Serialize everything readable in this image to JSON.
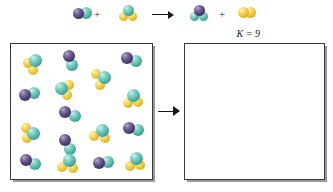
{
  "figure": {
    "type": "chemical-equilibrium-diagram",
    "equilibrium_constant_label": "K = 9"
  },
  "legend": {
    "atom_colors": {
      "purple": "#4a3a6b",
      "teal": "#4fb5a8",
      "yellow": "#e9c63c"
    }
  },
  "equation": {
    "plus_1": "+",
    "plus_2": "+",
    "arrow": "reaction-arrow",
    "reactants": [
      {
        "name": "diatomic-purple-teal",
        "atoms": [
          {
            "color": "purple",
            "x": 0,
            "y": 2,
            "d": 11,
            "z": 2
          },
          {
            "color": "teal",
            "x": 7,
            "y": 1,
            "d": 12,
            "z": 1
          }
        ]
      },
      {
        "name": "triatomic-teal-yellow",
        "atoms": [
          {
            "color": "teal",
            "x": 4,
            "y": 0,
            "d": 11,
            "z": 3
          },
          {
            "color": "yellow",
            "x": 0,
            "y": 7,
            "d": 9,
            "z": 2
          },
          {
            "color": "yellow",
            "x": 9,
            "y": 7,
            "d": 9,
            "z": 1
          }
        ]
      }
    ],
    "products": [
      {
        "name": "triatomic-purple-teal",
        "atoms": [
          {
            "color": "purple",
            "x": 4,
            "y": 0,
            "d": 11,
            "z": 3
          },
          {
            "color": "teal",
            "x": 0,
            "y": 7,
            "d": 9,
            "z": 2
          },
          {
            "color": "teal",
            "x": 9,
            "y": 7,
            "d": 9,
            "z": 1
          }
        ]
      },
      {
        "name": "diatomic-yellow-yellow",
        "atoms": [
          {
            "color": "yellow",
            "x": 0,
            "y": 1,
            "d": 11,
            "z": 2
          },
          {
            "color": "yellow",
            "x": 7,
            "y": 1,
            "d": 11,
            "z": 1
          }
        ]
      }
    ],
    "layout": {
      "reactant_1_x": 73,
      "reactant_1_y": 6,
      "plus_1_x": 94,
      "plus_1_y": 9,
      "reactant_2_x": 119,
      "reactant_2_y": 5,
      "arrow_x": 152,
      "arrow_y": 10,
      "arrow_width": 22,
      "product_1_x": 190,
      "product_1_y": 5,
      "plus_2_x": 219,
      "plus_2_y": 9,
      "product_2_x": 238,
      "product_2_y": 6
    }
  },
  "left_vessel": {
    "name": "initial-mixture-box",
    "x": 10,
    "y": 43,
    "width": 143,
    "height": 137,
    "molecules": [
      {
        "name": "triatomic-teal-yellow",
        "x": 12,
        "y": 10,
        "atoms": [
          {
            "color": "teal",
            "x": 6,
            "y": 0,
            "d": 13,
            "z": 3
          },
          {
            "color": "yellow",
            "x": 0,
            "y": 4,
            "d": 10,
            "z": 2
          },
          {
            "color": "yellow",
            "x": 5,
            "y": 11,
            "d": 10,
            "z": 1
          }
        ]
      },
      {
        "name": "diatomic-purple-teal",
        "x": 52,
        "y": 6,
        "atoms": [
          {
            "color": "purple",
            "x": 0,
            "y": 0,
            "d": 12,
            "z": 2
          },
          {
            "color": "teal",
            "x": 3,
            "y": 9,
            "d": 12,
            "z": 1
          }
        ]
      },
      {
        "name": "diatomic-purple-teal",
        "x": 110,
        "y": 8,
        "atoms": [
          {
            "color": "purple",
            "x": 0,
            "y": 0,
            "d": 12,
            "z": 2
          },
          {
            "color": "teal",
            "x": 9,
            "y": 3,
            "d": 12,
            "z": 1
          }
        ]
      },
      {
        "name": "triatomic-teal-yellow",
        "x": 44,
        "y": 36,
        "atoms": [
          {
            "color": "teal",
            "x": 0,
            "y": 2,
            "d": 13,
            "z": 3
          },
          {
            "color": "yellow",
            "x": 9,
            "y": 0,
            "d": 10,
            "z": 2
          },
          {
            "color": "yellow",
            "x": 7,
            "y": 10,
            "d": 10,
            "z": 1
          }
        ]
      },
      {
        "name": "triatomic-teal-yellow",
        "x": 80,
        "y": 25,
        "atoms": [
          {
            "color": "teal",
            "x": 7,
            "y": 2,
            "d": 13,
            "z": 3
          },
          {
            "color": "yellow",
            "x": 0,
            "y": 0,
            "d": 10,
            "z": 2
          },
          {
            "color": "yellow",
            "x": 4,
            "y": 11,
            "d": 10,
            "z": 1
          }
        ]
      },
      {
        "name": "diatomic-purple-teal",
        "x": 8,
        "y": 43,
        "atoms": [
          {
            "color": "purple",
            "x": 0,
            "y": 2,
            "d": 12,
            "z": 2
          },
          {
            "color": "teal",
            "x": 9,
            "y": 0,
            "d": 12,
            "z": 1
          }
        ]
      },
      {
        "name": "triatomic-teal-yellow",
        "x": 112,
        "y": 45,
        "atoms": [
          {
            "color": "teal",
            "x": 4,
            "y": 0,
            "d": 13,
            "z": 3
          },
          {
            "color": "yellow",
            "x": 0,
            "y": 9,
            "d": 10,
            "z": 2
          },
          {
            "color": "yellow",
            "x": 10,
            "y": 8,
            "d": 10,
            "z": 1
          }
        ]
      },
      {
        "name": "diatomic-purple-teal",
        "x": 48,
        "y": 62,
        "atoms": [
          {
            "color": "purple",
            "x": 0,
            "y": 0,
            "d": 12,
            "z": 2
          },
          {
            "color": "teal",
            "x": 10,
            "y": 4,
            "d": 12,
            "z": 1
          }
        ]
      },
      {
        "name": "triatomic-teal-yellow",
        "x": 10,
        "y": 79,
        "atoms": [
          {
            "color": "teal",
            "x": 6,
            "y": 4,
            "d": 13,
            "z": 3
          },
          {
            "color": "yellow",
            "x": 0,
            "y": 0,
            "d": 10,
            "z": 2
          },
          {
            "color": "yellow",
            "x": 1,
            "y": 10,
            "d": 10,
            "z": 1
          }
        ]
      },
      {
        "name": "triatomic-teal-yellow",
        "x": 78,
        "y": 80,
        "atoms": [
          {
            "color": "teal",
            "x": 7,
            "y": 0,
            "d": 13,
            "z": 3
          },
          {
            "color": "yellow",
            "x": 0,
            "y": 7,
            "d": 10,
            "z": 2
          },
          {
            "color": "yellow",
            "x": 11,
            "y": 9,
            "d": 10,
            "z": 1
          }
        ]
      },
      {
        "name": "diatomic-purple-teal",
        "x": 112,
        "y": 78,
        "atoms": [
          {
            "color": "purple",
            "x": 0,
            "y": 0,
            "d": 12,
            "z": 2
          },
          {
            "color": "teal",
            "x": 9,
            "y": 2,
            "d": 12,
            "z": 1
          }
        ]
      },
      {
        "name": "diatomic-purple-teal",
        "x": 48,
        "y": 90,
        "atoms": [
          {
            "color": "purple",
            "x": 0,
            "y": 0,
            "d": 12,
            "z": 2
          },
          {
            "color": "teal",
            "x": 5,
            "y": 9,
            "d": 12,
            "z": 1
          }
        ]
      },
      {
        "name": "diatomic-purple-teal",
        "x": 9,
        "y": 110,
        "atoms": [
          {
            "color": "purple",
            "x": 0,
            "y": 0,
            "d": 12,
            "z": 2
          },
          {
            "color": "teal",
            "x": 9,
            "y": 4,
            "d": 12,
            "z": 1
          }
        ]
      },
      {
        "name": "triatomic-teal-yellow",
        "x": 46,
        "y": 110,
        "atoms": [
          {
            "color": "teal",
            "x": 6,
            "y": 0,
            "d": 13,
            "z": 3
          },
          {
            "color": "yellow",
            "x": 0,
            "y": 8,
            "d": 10,
            "z": 2
          },
          {
            "color": "yellow",
            "x": 11,
            "y": 9,
            "d": 10,
            "z": 1
          }
        ]
      },
      {
        "name": "diatomic-purple-teal",
        "x": 82,
        "y": 112,
        "atoms": [
          {
            "color": "purple",
            "x": 0,
            "y": 1,
            "d": 12,
            "z": 2
          },
          {
            "color": "teal",
            "x": 9,
            "y": 0,
            "d": 12,
            "z": 1
          }
        ]
      },
      {
        "name": "triatomic-teal-yellow",
        "x": 114,
        "y": 108,
        "atoms": [
          {
            "color": "teal",
            "x": 5,
            "y": 0,
            "d": 13,
            "z": 3
          },
          {
            "color": "yellow",
            "x": 0,
            "y": 9,
            "d": 10,
            "z": 2
          },
          {
            "color": "yellow",
            "x": 10,
            "y": 8,
            "d": 10,
            "z": 1
          }
        ]
      },
      {
        "name": "triatomic-teal-yellow",
        "x": 14,
        "y": 2,
        "atoms": [
          {
            "color": "teal",
            "x": 0,
            "y": 0,
            "d": 0,
            "z": 0
          }
        ]
      },
      {
        "name": "diatomic-purple-teal",
        "x": 78,
        "y": 52,
        "atoms": [
          {
            "color": "purple",
            "x": 0,
            "y": 0,
            "d": 0,
            "z": 0
          }
        ]
      }
    ]
  },
  "transform_arrow": {
    "name": "transformation-arrow",
    "x": 158,
    "y": 106,
    "width": 22
  },
  "right_vessel": {
    "name": "equilibrium-mixture-box",
    "x": 184,
    "y": 43,
    "width": 141,
    "height": 137,
    "molecules": []
  }
}
